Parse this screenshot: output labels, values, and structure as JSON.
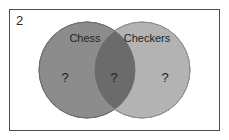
{
  "figure": {
    "question_number": "2",
    "frame_color": "#4d4d4d",
    "background_color": "#ffffff"
  },
  "chart_data": {
    "type": "venn",
    "title": "",
    "sets": [
      {
        "id": "left",
        "label": "Chess",
        "fill": "#8c8c8c",
        "stroke": "#6e6e6e",
        "center_x": 78,
        "center_y": 61,
        "radius": 48
      },
      {
        "id": "right",
        "label": "Checkers",
        "fill": "#b3b3b3",
        "stroke": "#8f8f8f",
        "center_x": 133,
        "center_y": 61,
        "radius": 48
      }
    ],
    "intersection": {
      "label": "",
      "fill": "#6b6b6b",
      "stroke": "#5c5c5c"
    },
    "regions": [
      {
        "id": "left-only",
        "set": "Chess",
        "value": "?",
        "x": 56,
        "y": 70
      },
      {
        "id": "intersection",
        "set": "Chess and Checkers",
        "value": "?",
        "x": 105,
        "y": 70
      },
      {
        "id": "right-only",
        "set": "Checkers",
        "value": "?",
        "x": 156,
        "y": 70
      }
    ],
    "labels": [
      {
        "id": "left-label",
        "text": "Chess",
        "x": 76,
        "y": 30
      },
      {
        "id": "right-label",
        "text": "Checkers",
        "x": 138,
        "y": 30
      }
    ]
  }
}
